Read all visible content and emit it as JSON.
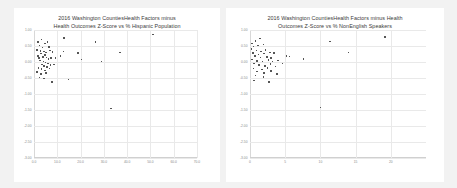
{
  "page": {
    "background_color": "#f2f2f2",
    "panel_color": "#ffffff",
    "marker_color": "#555555",
    "grid_color": "#e9e9e9",
    "tick_text_color": "#8a8a8a"
  },
  "chart_data": [
    {
      "type": "scatter",
      "id": "hispanic",
      "title_line1": "2016 Washington CountiesHealth Factors minus",
      "title_line2": "Health Outcomes Z-Score  vs % Hispanic Population",
      "xlabel": "",
      "ylabel": "",
      "xlim": [
        0,
        70
      ],
      "ylim": [
        -3.0,
        1.0
      ],
      "grid": true,
      "legend": "none",
      "xticks": [
        "0.0",
        "10.0",
        "20.0",
        "30.0",
        "40.0",
        "50.0",
        "60.0",
        "70.0"
      ],
      "xtick_values": [
        0,
        10,
        20,
        30,
        40,
        50,
        60,
        70
      ],
      "yticks": [
        "1.00",
        "0.50",
        "0.00",
        "-0.50",
        "-1.00",
        "-1.50",
        "-2.00",
        "-2.50",
        "-3.00"
      ],
      "ytick_values": [
        1.0,
        0.5,
        0.0,
        -0.5,
        -1.0,
        -1.5,
        -2.0,
        -2.5,
        -3.0
      ],
      "points": [
        [
          1.8,
          0.62
        ],
        [
          3.2,
          0.7
        ],
        [
          2.4,
          0.52
        ],
        [
          4.6,
          0.58
        ],
        [
          5.8,
          0.63
        ],
        [
          3.6,
          0.45
        ],
        [
          6.4,
          0.47
        ],
        [
          1.2,
          0.38
        ],
        [
          2.8,
          0.34
        ],
        [
          4.2,
          0.33
        ],
        [
          5.2,
          0.3
        ],
        [
          6.8,
          0.36
        ],
        [
          8.0,
          0.31
        ],
        [
          3.0,
          0.26
        ],
        [
          4.8,
          0.22
        ],
        [
          1.6,
          0.18
        ],
        [
          2.2,
          0.12
        ],
        [
          3.8,
          0.16
        ],
        [
          5.4,
          0.14
        ],
        [
          6.2,
          0.1
        ],
        [
          7.4,
          0.12
        ],
        [
          9.2,
          0.13
        ],
        [
          2.6,
          0.05
        ],
        [
          4.0,
          0.02
        ],
        [
          5.0,
          -0.02
        ],
        [
          6.0,
          -0.05
        ],
        [
          3.4,
          -0.08
        ],
        [
          4.4,
          -0.12
        ],
        [
          5.6,
          -0.15
        ],
        [
          7.0,
          -0.1
        ],
        [
          8.6,
          -0.08
        ],
        [
          2.0,
          -0.18
        ],
        [
          3.2,
          -0.22
        ],
        [
          4.6,
          -0.26
        ],
        [
          6.6,
          -0.2
        ],
        [
          1.4,
          -0.32
        ],
        [
          3.0,
          -0.38
        ],
        [
          5.2,
          -0.34
        ],
        [
          2.4,
          -0.48
        ],
        [
          4.2,
          -0.52
        ],
        [
          7.8,
          -0.62
        ],
        [
          13.0,
          0.75
        ],
        [
          12.6,
          0.33
        ],
        [
          11.4,
          0.18
        ],
        [
          14.8,
          -0.55
        ],
        [
          19.0,
          0.28
        ],
        [
          20.4,
          0.08
        ],
        [
          26.4,
          0.62
        ],
        [
          29.0,
          0.02
        ],
        [
          37.0,
          0.3
        ],
        [
          33.0,
          -1.45
        ],
        [
          51.0,
          0.86
        ]
      ]
    },
    {
      "type": "scatter",
      "id": "nonenglish",
      "title_line1": "2016 Washington CountiesHealth Factors minus Health",
      "title_line2": "Outcomes Z-Score  vs % NonEnglish Speakers",
      "xlabel": "",
      "ylabel": "",
      "xlim": [
        0,
        25
      ],
      "ylim": [
        -3.0,
        1.0
      ],
      "grid": true,
      "legend": "none",
      "xticks": [
        "0",
        "5",
        "10",
        "15",
        "20"
      ],
      "xtick_values": [
        0,
        5,
        10,
        15,
        20
      ],
      "yticks": [
        "1.00",
        "0.50",
        "0.00",
        "-0.50",
        "-1.00",
        "-1.50",
        "-2.00",
        "-2.50",
        "-3.00"
      ],
      "ytick_values": [
        1.0,
        0.5,
        0.0,
        -0.5,
        -1.0,
        -1.5,
        -2.0,
        -2.5,
        -3.0
      ],
      "points": [
        [
          0.3,
          0.58
        ],
        [
          0.8,
          0.66
        ],
        [
          1.4,
          0.74
        ],
        [
          0.5,
          0.48
        ],
        [
          1.1,
          0.52
        ],
        [
          1.9,
          0.55
        ],
        [
          0.2,
          0.4
        ],
        [
          0.9,
          0.36
        ],
        [
          1.6,
          0.33
        ],
        [
          2.2,
          0.38
        ],
        [
          0.4,
          0.28
        ],
        [
          1.2,
          0.24
        ],
        [
          2.0,
          0.26
        ],
        [
          2.8,
          0.3
        ],
        [
          3.4,
          0.29
        ],
        [
          0.7,
          0.18
        ],
        [
          1.5,
          0.14
        ],
        [
          2.4,
          0.16
        ],
        [
          3.0,
          0.12
        ],
        [
          0.3,
          0.08
        ],
        [
          1.0,
          0.04
        ],
        [
          1.8,
          0.02
        ],
        [
          2.6,
          0.06
        ],
        [
          3.2,
          0.01
        ],
        [
          4.0,
          0.05
        ],
        [
          0.6,
          -0.05
        ],
        [
          1.3,
          -0.09
        ],
        [
          2.1,
          -0.12
        ],
        [
          2.9,
          -0.07
        ],
        [
          3.6,
          -0.14
        ],
        [
          0.5,
          -0.2
        ],
        [
          1.7,
          -0.24
        ],
        [
          2.5,
          -0.18
        ],
        [
          1.0,
          -0.3
        ],
        [
          2.0,
          -0.34
        ],
        [
          3.0,
          -0.28
        ],
        [
          0.8,
          -0.42
        ],
        [
          1.9,
          -0.46
        ],
        [
          3.8,
          -0.38
        ],
        [
          0.6,
          -0.58
        ],
        [
          2.7,
          -0.62
        ],
        [
          5.2,
          0.18
        ],
        [
          5.6,
          0.17
        ],
        [
          7.6,
          0.1
        ],
        [
          4.6,
          -0.05
        ],
        [
          11.4,
          0.64
        ],
        [
          14.0,
          0.3
        ],
        [
          19.2,
          0.78
        ],
        [
          10.0,
          -1.42
        ]
      ]
    }
  ]
}
